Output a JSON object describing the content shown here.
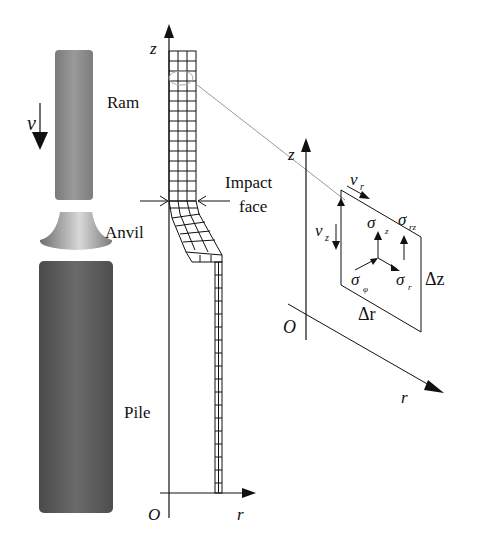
{
  "figure": {
    "components": {
      "ram": "Ram",
      "anvil": "Anvil",
      "pile": "Pile",
      "velocity": "v"
    },
    "mesh_axes": {
      "z_axis": "z",
      "r_axis": "r",
      "origin": "O",
      "impact_face_line1": "Impact",
      "impact_face_line2": "face"
    },
    "element": {
      "z_axis": "z",
      "r_axis": "r",
      "origin": "O",
      "v_r": "v",
      "v_r_sub": "r",
      "v_z": "v",
      "v_z_sub": "z",
      "sigma_z": "σ",
      "sigma_z_sub": "z",
      "sigma_rz": "σ",
      "sigma_rz_sub": "rz",
      "sigma_phi": "σ",
      "sigma_phi_sub": "φ",
      "sigma_r": "σ",
      "sigma_r_sub": "r",
      "delta_z": "Δz",
      "delta_r": "Δr"
    },
    "colors": {
      "ram": "#8a8a8a",
      "pile": "#5a5a5a",
      "anvil": "#9c9c9c",
      "line": "#111111"
    }
  }
}
